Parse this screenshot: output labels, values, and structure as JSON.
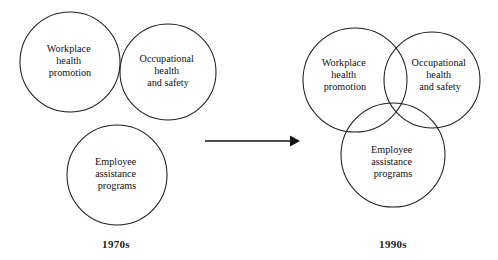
{
  "diagram": {
    "type": "venn-evolution",
    "background_color": "#ffffff",
    "stroke_color": "#1f1f1f",
    "text_color": "#111111"
  },
  "panels": [
    {
      "id": "panel-1970s",
      "label": "1970s",
      "label_x": 116,
      "label_y": 238,
      "overlap": "separate",
      "circles": [
        {
          "id": "whp-1970s",
          "name": "workplace-health-promotion",
          "cx": 70,
          "cy": 62,
          "r": 50,
          "lines": [
            "Workplace",
            "health",
            "promotion"
          ],
          "text_x": 70,
          "text_y": 62
        },
        {
          "id": "ohs-1970s",
          "name": "occupational-health-and-safety",
          "cx": 168,
          "cy": 72,
          "r": 48,
          "lines": [
            "Occupational",
            "health",
            "and safety"
          ],
          "text_x": 168,
          "text_y": 72
        },
        {
          "id": "eap-1970s",
          "name": "employee-assistance-programs",
          "cx": 117,
          "cy": 175,
          "r": 50,
          "lines": [
            "Employee",
            "assistance",
            "programs"
          ],
          "text_x": 117,
          "text_y": 175
        }
      ]
    },
    {
      "id": "panel-1990s",
      "label": "1990s",
      "label_x": 393,
      "label_y": 238,
      "overlap": "three-way-intersecting",
      "circles": [
        {
          "id": "whp-1990s",
          "name": "workplace-health-promotion",
          "cx": 355,
          "cy": 80,
          "r": 52,
          "lines": [
            "Workplace",
            "health",
            "promotion"
          ],
          "text_x": 345,
          "text_y": 76
        },
        {
          "id": "ohs-1990s",
          "name": "occupational-health-and-safety",
          "cx": 432,
          "cy": 80,
          "r": 48,
          "lines": [
            "Occupational",
            "health",
            "and safety"
          ],
          "text_x": 440,
          "text_y": 76
        },
        {
          "id": "eap-1990s",
          "name": "employee-assistance-programs",
          "cx": 393,
          "cy": 155,
          "r": 52,
          "lines": [
            "Employee",
            "assistance",
            "programs"
          ],
          "text_x": 393,
          "text_y": 163
        }
      ]
    }
  ],
  "arrow": {
    "name": "transition-arrow",
    "x1": 205,
    "y1": 141,
    "x2": 290,
    "y2": 141,
    "head_points": "290,135.5 300,141 290,146.5"
  }
}
